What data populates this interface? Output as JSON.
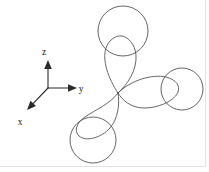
{
  "figure": {
    "background_color": "#ffffff",
    "curve_color": "#4a4a4a",
    "axis_color": "#2b2b2b",
    "frame_color": "#e2e2e2",
    "width": 209,
    "height": 172
  },
  "axes": {
    "origin": {
      "x": 48,
      "y": 88
    },
    "labels": {
      "z": "z",
      "y": "y",
      "x": "x"
    },
    "z_axis": {
      "label": "z",
      "direction": "up",
      "tip": {
        "x": 48,
        "y": 60
      },
      "label_pos": {
        "x": 44,
        "y": 55
      }
    },
    "y_axis": {
      "label": "y",
      "direction": "right",
      "tip": {
        "x": 77,
        "y": 88
      },
      "label_pos": {
        "x": 81,
        "y": 92
      }
    },
    "x_axis": {
      "label": "x",
      "direction": "down-left",
      "tip": {
        "x": 27,
        "y": 110
      },
      "label_pos": {
        "x": 20,
        "y": 125
      }
    }
  },
  "orbital": {
    "center": {
      "x": 118,
      "y": 93
    },
    "lobes": [
      {
        "name": "lobe-up-z",
        "direction": "up",
        "tip": {
          "x": 121,
          "y": 36
        },
        "circle": {
          "cx": 123,
          "cy": 31,
          "r": 25
        }
      },
      {
        "name": "lobe-right-y",
        "direction": "right",
        "tip": {
          "x": 171,
          "y": 89
        },
        "circle": {
          "cx": 182,
          "cy": 89,
          "r": 21
        }
      },
      {
        "name": "lobe-lower-left-x",
        "direction": "down-left",
        "tip": {
          "x": 97,
          "y": 133
        },
        "circle": {
          "cx": 93,
          "cy": 140,
          "r": 23
        }
      }
    ],
    "lobe_count": 3,
    "circle_count": 3
  }
}
